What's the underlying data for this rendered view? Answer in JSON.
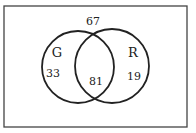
{
  "diagram": {
    "type": "venn",
    "universe": {
      "outside_count": "67"
    },
    "sets": [
      {
        "label": "G",
        "only_count": "33"
      },
      {
        "label": "R",
        "only_count": "19"
      }
    ],
    "intersection_count": "81",
    "colors": {
      "stroke": "#222222",
      "frame": "#444444",
      "background": "#ffffff"
    }
  }
}
